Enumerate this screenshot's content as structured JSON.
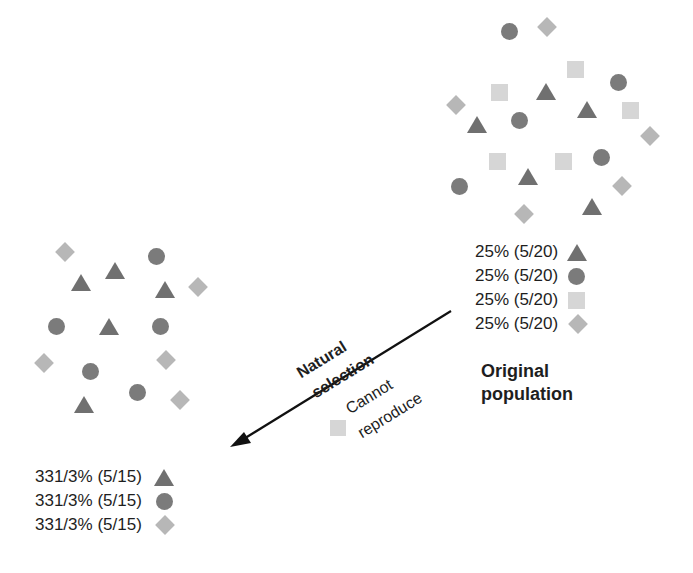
{
  "original_population": {
    "title_line1": "Original",
    "title_line2": "population",
    "legend": [
      {
        "label": "25% (5/20)",
        "shape": "triangle"
      },
      {
        "label": "25% (5/20)",
        "shape": "circle"
      },
      {
        "label": "25% (5/20)",
        "shape": "square"
      },
      {
        "label": "25% (5/20)",
        "shape": "diamond"
      }
    ],
    "counts": {
      "triangle": 5,
      "circle": 5,
      "square": 5,
      "diamond": 5,
      "total": 20
    }
  },
  "arrow": {
    "label_line1": "Natural",
    "label_line2": "selection",
    "note_line1": "Cannot",
    "note_line2": "reproduce",
    "note_shape": "square"
  },
  "selected_population": {
    "legend": [
      {
        "label": "331/3% (5/15)",
        "shape": "triangle"
      },
      {
        "label": "331/3% (5/15)",
        "shape": "circle"
      },
      {
        "label": "331/3% (5/15)",
        "shape": "diamond"
      }
    ],
    "counts": {
      "triangle": 5,
      "circle": 5,
      "diamond": 5,
      "total": 15
    }
  },
  "colors": {
    "triangle": "#707070",
    "circle": "#7b7b7b",
    "square": "#d6d6d6",
    "diamond": "#b7b7b7",
    "text": "#1e1e1e"
  }
}
